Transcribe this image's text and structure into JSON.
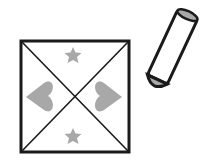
{
  "illustration": {
    "description": "Square divided by diagonals with two stars and two hearts, beside a crayon",
    "colors": {
      "outline": "#1a1a1a",
      "fill": "#a8a8a8",
      "background": "#ffffff"
    },
    "shapes": [
      {
        "type": "star",
        "position": "top"
      },
      {
        "type": "heart",
        "position": "left"
      },
      {
        "type": "heart",
        "position": "right"
      },
      {
        "type": "star",
        "position": "bottom"
      }
    ],
    "tool": "crayon-icon"
  }
}
